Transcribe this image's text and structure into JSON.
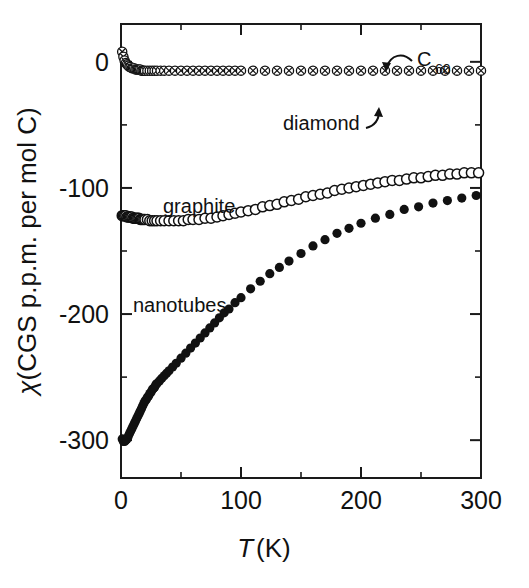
{
  "figure": {
    "background_color": "#ffffff",
    "ink_color": "#111111"
  },
  "axes": {
    "x": {
      "title_italic": "T",
      "title_rest": "(K)",
      "min": 0,
      "max": 300,
      "major_ticks": [
        0,
        100,
        200,
        300
      ],
      "major_tick_labels": [
        "0",
        "100",
        "200",
        "300"
      ],
      "minor_ticks": [
        50,
        150,
        250
      ]
    },
    "y": {
      "title_italic": "χ",
      "title_rest": "(CGS p.p.m. per mol C)",
      "min": -330,
      "max": 30,
      "major_ticks": [
        0,
        -100,
        -200,
        -300
      ],
      "major_tick_labels": [
        "0",
        "-100",
        "-200",
        "-300"
      ],
      "minor_ticks": [
        -50,
        -150,
        -250
      ]
    }
  },
  "annotations": [
    {
      "name": "c60-label",
      "text": "C",
      "subscript": "60",
      "x": 403,
      "y": 62
    },
    {
      "name": "diamond-label",
      "text": "diamond",
      "x": 283,
      "y": 130
    },
    {
      "name": "graphite-label",
      "text": "graphite",
      "x": 163,
      "y": 213
    },
    {
      "name": "nanotubes-label",
      "text": "nanotubes",
      "x": 133,
      "y": 312
    }
  ],
  "chart_data": {
    "type": "scatter",
    "title": "",
    "xlabel": "T (K)",
    "ylabel": "χ (CGS p.p.m. per mol C)",
    "xlim": [
      0,
      300
    ],
    "ylim": [
      -330,
      30
    ],
    "grid": false,
    "legend": "inline annotations",
    "series": [
      {
        "name": "C60 / diamond",
        "marker": "crossed-circle",
        "fill": "none",
        "color": "#111111",
        "x": [
          1,
          2,
          3,
          4,
          5,
          6,
          7,
          8,
          9,
          10,
          11,
          12,
          13,
          14,
          15,
          16,
          17,
          18,
          19,
          20,
          22,
          24,
          26,
          28,
          30,
          33,
          36,
          40,
          45,
          50,
          55,
          60,
          65,
          70,
          75,
          80,
          85,
          90,
          95,
          100,
          110,
          120,
          130,
          140,
          150,
          160,
          170,
          180,
          190,
          200,
          210,
          220,
          230,
          240,
          250,
          260,
          270,
          280,
          290,
          300
        ],
        "y": [
          8,
          4,
          1,
          -1,
          -2,
          -3,
          -4,
          -4,
          -5,
          -5,
          -5,
          -6,
          -6,
          -6,
          -6,
          -6,
          -7,
          -7,
          -7,
          -7,
          -7,
          -7,
          -7,
          -7,
          -7,
          -7,
          -7,
          -7,
          -7,
          -7,
          -7,
          -7,
          -7,
          -7,
          -7,
          -7,
          -7,
          -7,
          -7,
          -7,
          -7,
          -7,
          -7,
          -7,
          -7,
          -7,
          -7,
          -7,
          -7,
          -7,
          -7,
          -7,
          -7,
          -7,
          -7,
          -7,
          -7,
          -7,
          -7,
          -7
        ]
      },
      {
        "name": "graphite",
        "marker": "open-circle",
        "fill": "#ffffff",
        "color": "#111111",
        "x": [
          1,
          2,
          3,
          4,
          5,
          6,
          7,
          8,
          9,
          10,
          11,
          12,
          13,
          14,
          15,
          16,
          17,
          18,
          19,
          20,
          22,
          24,
          26,
          28,
          30,
          33,
          36,
          40,
          44,
          48,
          52,
          56,
          60,
          65,
          70,
          75,
          80,
          85,
          90,
          95,
          100,
          106,
          112,
          118,
          124,
          130,
          136,
          142,
          148,
          154,
          160,
          166,
          172,
          178,
          184,
          190,
          196,
          202,
          208,
          214,
          220,
          226,
          232,
          238,
          244,
          250,
          256,
          262,
          268,
          274,
          280,
          286,
          292,
          298
        ],
        "y": [
          -122,
          -122,
          -122,
          -122,
          -123,
          -123,
          -123,
          -123,
          -123,
          -124,
          -124,
          -124,
          -124,
          -124,
          -124,
          -125,
          -125,
          -125,
          -125,
          -125,
          -125,
          -126,
          -126,
          -126,
          -126,
          -126,
          -126,
          -126,
          -126,
          -126,
          -126,
          -125,
          -125,
          -125,
          -124,
          -124,
          -123,
          -122,
          -121,
          -120,
          -119,
          -118,
          -117,
          -115,
          -114,
          -113,
          -111,
          -110,
          -109,
          -107,
          -106,
          -105,
          -104,
          -102,
          -101,
          -100,
          -99,
          -98,
          -97,
          -96,
          -95,
          -94,
          -94,
          -93,
          -92,
          -92,
          -91,
          -90,
          -90,
          -89,
          -89,
          -88,
          -88,
          -88
        ]
      },
      {
        "name": "nanotubes",
        "marker": "filled-circle",
        "fill": "#111111",
        "color": "#111111",
        "x": [
          1,
          2,
          3,
          4,
          5,
          6,
          7,
          8,
          9,
          10,
          11,
          12,
          13,
          14,
          15,
          16,
          17,
          18,
          19,
          20,
          21,
          22,
          23,
          24,
          25,
          26,
          27,
          28,
          29,
          30,
          32,
          34,
          36,
          38,
          40,
          43,
          46,
          50,
          54,
          58,
          62,
          66,
          70,
          74,
          78,
          82,
          86,
          90,
          95,
          100,
          108,
          116,
          124,
          132,
          140,
          150,
          160,
          170,
          180,
          190,
          200,
          212,
          224,
          236,
          248,
          260,
          272,
          284,
          296
        ],
        "y": [
          -299,
          -301,
          -301,
          -300,
          -299,
          -297,
          -295,
          -293,
          -291,
          -289,
          -287,
          -285,
          -283,
          -281,
          -279,
          -277,
          -275,
          -273,
          -271,
          -269,
          -268,
          -266,
          -265,
          -263,
          -262,
          -260,
          -259,
          -258,
          -256,
          -255,
          -253,
          -251,
          -249,
          -247,
          -245,
          -242,
          -239,
          -235,
          -231,
          -227,
          -223,
          -219,
          -215,
          -211,
          -207,
          -203,
          -199,
          -196,
          -191,
          -187,
          -180,
          -174,
          -168,
          -163,
          -158,
          -152,
          -146,
          -141,
          -136,
          -132,
          -128,
          -124,
          -121,
          -117,
          -115,
          -112,
          -110,
          -108,
          -106
        ]
      }
    ]
  }
}
